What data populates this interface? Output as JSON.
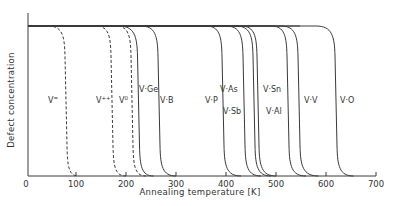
{
  "chart_data": {
    "type": "line",
    "title": "",
    "xlabel": "Annealing temperature  [K]",
    "ylabel": "Defect concentration",
    "xlim": [
      0,
      700
    ],
    "ylim": [
      0,
      1
    ],
    "x_ticks": [
      0,
      100,
      200,
      300,
      400,
      500,
      600,
      700
    ],
    "x_tick_labels": [
      "0",
      "100",
      "200",
      "300",
      "400",
      "500",
      "600",
      "700"
    ],
    "y_ticks": [],
    "grid": false,
    "legend": "none (curves labeled inline)",
    "series": [
      {
        "name": "V=",
        "label_main": "V",
        "label_sup": "=",
        "style": "dashed",
        "t_start": 45,
        "t_mid": 80,
        "t_end": 105,
        "label_x": 48,
        "label_y": 100
      },
      {
        "name": "V++",
        "label_main": "V",
        "label_sup": "++",
        "style": "dashed",
        "t_start": 140,
        "t_mid": 172,
        "t_end": 200,
        "label_x": 96,
        "label_y": 100
      },
      {
        "name": "V0",
        "label_main": "V",
        "label_sup": "0",
        "style": "dashed",
        "t_start": 180,
        "t_mid": 212,
        "t_end": 240,
        "label_x": 119,
        "label_y": 100
      },
      {
        "name": "V·Ge",
        "label_main": "V·Ge",
        "label_sup": "",
        "style": "solid",
        "t_start": 185,
        "t_mid": 225,
        "t_end": 255,
        "label_x": 139,
        "label_y": 89
      },
      {
        "name": "V·B",
        "label_main": "V·B",
        "label_sup": "",
        "style": "solid",
        "t_start": 230,
        "t_mid": 266,
        "t_end": 300,
        "label_x": 160,
        "label_y": 100
      },
      {
        "name": "V·P",
        "label_main": "V·P",
        "label_sup": "",
        "style": "solid",
        "t_start": 360,
        "t_mid": 394,
        "t_end": 430,
        "label_x": 205,
        "label_y": 100
      },
      {
        "name": "V·As",
        "label_main": "V·As",
        "label_sup": "",
        "style": "solid",
        "t_start": 400,
        "t_mid": 436,
        "t_end": 470,
        "label_x": 220,
        "label_y": 89
      },
      {
        "name": "V·Sb",
        "label_main": "V·Sb",
        "label_sup": "",
        "style": "solid",
        "t_start": 420,
        "t_mid": 456,
        "t_end": 490,
        "label_x": 223,
        "label_y": 111
      },
      {
        "name": "V·Sn",
        "label_main": "V·Sn",
        "label_sup": "",
        "style": "solid",
        "t_start": 430,
        "t_mid": 464,
        "t_end": 500,
        "label_x": 263,
        "label_y": 89
      },
      {
        "name": "V·Al",
        "label_main": "V·Al",
        "label_sup": "",
        "style": "solid",
        "t_start": 490,
        "t_mid": 524,
        "t_end": 560,
        "label_x": 266,
        "label_y": 111
      },
      {
        "name": "V·V",
        "label_main": "V·V",
        "label_sup": "",
        "style": "solid",
        "t_start": 510,
        "t_mid": 546,
        "t_end": 585,
        "label_x": 304,
        "label_y": 100
      },
      {
        "name": "V·O",
        "label_main": "V·O",
        "label_sup": "",
        "style": "solid",
        "t_start": 580,
        "t_mid": 620,
        "t_end": 655,
        "label_x": 340,
        "label_y": 100
      }
    ],
    "value_description": "Each curve is a step-like anneal-out profile: normalized defect concentration 1 below t_start, dropping through 0.5 near t_mid, reaching 0 by t_end (temperatures in K, read off axis)."
  },
  "colors": {
    "background": "#ffffff",
    "ink": "#3a3a3a"
  }
}
